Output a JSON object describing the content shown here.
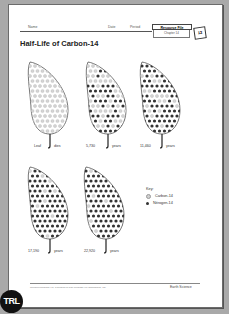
{
  "header": {
    "name_label": "Name",
    "date_label": "Date",
    "period_label": "Period",
    "resource_file": "Resource File",
    "chapter": "Chapter 14",
    "page_number": "12"
  },
  "title": "Half-Life of Carbon-14",
  "leaves": [
    {
      "label_left": "Leaf",
      "label_right": "dies",
      "c14_fraction": 1.0
    },
    {
      "label_left": "5,730",
      "label_right": "years",
      "c14_fraction": 0.5
    },
    {
      "label_left": "11,460",
      "label_right": "years",
      "c14_fraction": 0.25
    },
    {
      "label_left": "17,190",
      "label_right": "years",
      "c14_fraction": 0.125
    },
    {
      "label_left": "22,920",
      "label_right": "years",
      "c14_fraction": 0.0625
    }
  ],
  "key": {
    "title": "Key:",
    "items": [
      {
        "label": "Carbon-14",
        "color": "#d0d0d0"
      },
      {
        "label": "Nitrogen-14",
        "color": "#333333"
      }
    ]
  },
  "footer": {
    "copyright": "Glencoe/McGraw-Hill, a division of The McGraw-Hill Companies, Inc.",
    "subject": "Earth Science"
  },
  "badge": "TRL"
}
